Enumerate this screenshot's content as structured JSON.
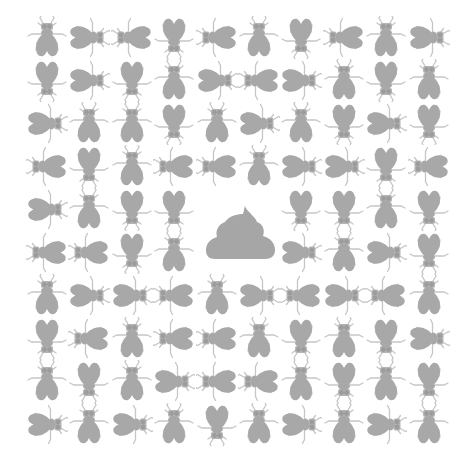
{
  "illustration": {
    "subject": "flies surrounding poop",
    "background_color": "#ffffff",
    "fly_body_color": "#a8a8a8",
    "fly_leg_color": "#c6c6c6",
    "poop_color": "#a6a6a6",
    "grid": {
      "rows": 10,
      "cols": 10,
      "center_icon": "poop-icon",
      "center_cells": [
        [
          4,
          4
        ],
        [
          4,
          5
        ],
        [
          5,
          4
        ],
        [
          5,
          5
        ]
      ],
      "orientations": [
        [
          "up",
          "right",
          "left",
          "down",
          "left",
          "up",
          "down",
          "left",
          "up",
          "right"
        ],
        [
          "down",
          "right",
          "down",
          "up",
          "right",
          "left",
          "right",
          "up",
          "down",
          "up"
        ],
        [
          "right",
          "up",
          "up",
          "down",
          "up",
          "right",
          "up",
          "down",
          "right",
          "down"
        ],
        [
          "left",
          "down",
          "up",
          "left",
          "left",
          "up",
          "right",
          "right",
          "down",
          "left"
        ],
        [
          "right",
          "up",
          "down",
          "down",
          null,
          null,
          "down",
          "down",
          "up",
          "down"
        ],
        [
          "left",
          "left",
          "down",
          "up",
          null,
          null,
          "right",
          "up",
          "right",
          "down"
        ],
        [
          "up",
          "right",
          "right",
          "left",
          "up",
          "right",
          "left",
          "right",
          "left",
          "up"
        ],
        [
          "down",
          "left",
          "up",
          "left",
          "left",
          "up",
          "down",
          "up",
          "down",
          "right"
        ],
        [
          "up",
          "down",
          "up",
          "right",
          "left",
          "left",
          "up",
          "down",
          "up",
          "down"
        ],
        [
          "right",
          "up",
          "right",
          "up",
          "down",
          "up",
          "right",
          "up",
          "right",
          "up"
        ]
      ]
    }
  }
}
